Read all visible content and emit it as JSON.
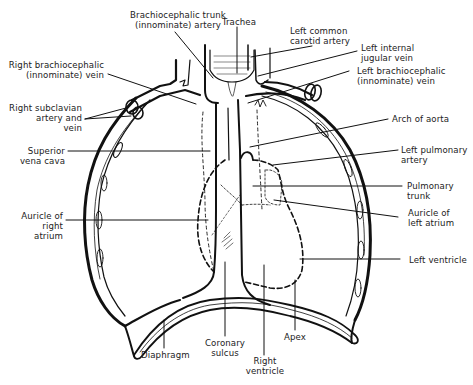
{
  "diagram": {
    "line_color": "#111111",
    "background": "#ffffff",
    "labels": {
      "brachiocephalic_trunk": "Brachiocephalic trunk\n(innominate) artery",
      "trachea": "Trachea",
      "left_common_carotid": "Left common\ncarotid artery",
      "left_internal_jugular": "Left internal\njugular vein",
      "right_brachiocephalic_vein": "Right brachiocephalic\n(innominate) vein",
      "left_brachiocephalic_vein": "Left brachiocephalic\n(innominate) vein",
      "right_subclavian": "Right subclavian\nartery and\nvein",
      "arch_of_aorta": "Arch of aorta",
      "superior_vena_cava": "Superior\nvena cava",
      "left_pulmonary_artery": "Left pulmonary\nartery",
      "pulmonary_trunk": "Pulmonary\ntrunk",
      "auricle_right_atrium": "Auricle of\nright\natrium",
      "auricle_left_atrium": "Auricle of\nleft atrium",
      "left_ventricle": "Left ventricle",
      "diaphragm": "Diaphragm",
      "coronary_sulcus": "Coronary\nsulcus",
      "apex": "Apex",
      "right_ventricle": "Right\nventricle"
    }
  }
}
